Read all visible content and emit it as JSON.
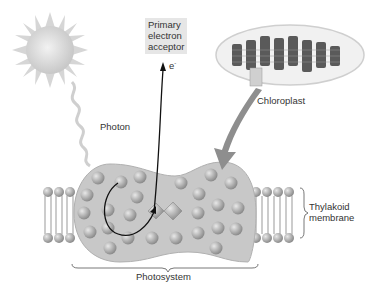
{
  "diagram": {
    "labels": {
      "primary_acceptor": [
        "Primary",
        "electron",
        "acceptor"
      ],
      "electron": "e",
      "electron_sup": "-",
      "photon": "Photon",
      "chloroplast": "Chloroplast",
      "thylakoid": [
        "Thylakoid",
        "membrane"
      ],
      "photosystem": "Photosystem"
    },
    "colors": {
      "photosystem_fill": "#c8c8c8",
      "pigment": "#a8a8a8",
      "sun": "#dcdcdc",
      "arrow": "#888888",
      "label_box": "#e6e6e6"
    }
  }
}
